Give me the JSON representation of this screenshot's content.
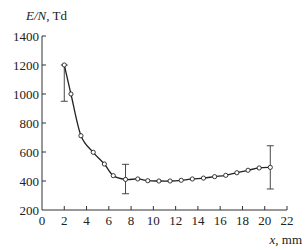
{
  "chart_data": {
    "type": "line",
    "title": "",
    "ylabel_italic": "E/N",
    "ylabel_unit": ", Td",
    "xlabel_italic": "x",
    "xlabel_unit": ", mm",
    "xlim": [
      0,
      22
    ],
    "ylim": [
      200,
      1400
    ],
    "xticks": [
      0,
      2,
      4,
      6,
      8,
      10,
      12,
      14,
      16,
      18,
      20,
      22
    ],
    "yticks": [
      200,
      400,
      600,
      800,
      1000,
      1200,
      1400
    ],
    "grid": false,
    "legend": "none",
    "series": [
      {
        "name": "E/N",
        "marker": "open-circle",
        "x": [
          2.0,
          2.6,
          3.5,
          4.6,
          5.6,
          6.4,
          7.5,
          8.6,
          9.5,
          10.5,
          11.5,
          12.5,
          13.5,
          14.5,
          15.5,
          16.5,
          17.5,
          18.5,
          19.5,
          20.5
        ],
        "y": [
          1200,
          1000,
          712,
          598,
          517,
          437,
          411,
          414,
          402,
          400,
          400,
          405,
          414,
          420,
          430,
          439,
          457,
          474,
          490,
          494
        ]
      }
    ],
    "error_bars": [
      {
        "x": 2.0,
        "y": 1200,
        "low": 950,
        "high": 1200
      },
      {
        "x": 7.5,
        "y": 411,
        "low": 312,
        "high": 515
      },
      {
        "x": 20.5,
        "y": 494,
        "low": 345,
        "high": 643
      }
    ]
  }
}
